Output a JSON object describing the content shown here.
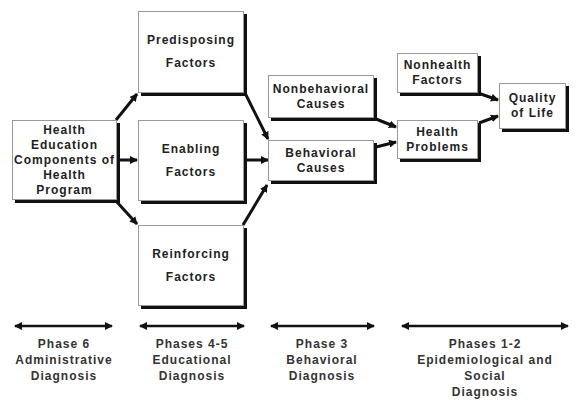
{
  "diagram": {
    "boxes": {
      "health_education": {
        "lines": [
          "Health",
          "Education",
          "Components of",
          "Health Program"
        ]
      },
      "predisposing": {
        "lines": [
          "Predisposing",
          "Factors"
        ]
      },
      "enabling": {
        "lines": [
          "Enabling",
          "Factors"
        ]
      },
      "reinforcing": {
        "lines": [
          "Reinforcing",
          "Factors"
        ]
      },
      "nonbehavioral": {
        "lines": [
          "Nonbehavioral",
          "Causes"
        ]
      },
      "behavioral": {
        "lines": [
          "Behavioral",
          "Causes"
        ]
      },
      "nonhealth": {
        "lines": [
          "Nonhealth",
          "Factors"
        ]
      },
      "health_problems": {
        "lines": [
          "Health",
          "Problems"
        ]
      },
      "quality_of_life": {
        "lines": [
          "Quality",
          "of Life"
        ]
      }
    },
    "edges": [
      {
        "from": "health_education",
        "to": "predisposing"
      },
      {
        "from": "health_education",
        "to": "enabling"
      },
      {
        "from": "health_education",
        "to": "reinforcing"
      },
      {
        "from": "predisposing",
        "to": "behavioral"
      },
      {
        "from": "enabling",
        "to": "behavioral"
      },
      {
        "from": "reinforcing",
        "to": "behavioral"
      },
      {
        "from": "nonbehavioral",
        "to": "health_problems"
      },
      {
        "from": "behavioral",
        "to": "health_problems"
      },
      {
        "from": "nonhealth",
        "to": "quality_of_life"
      },
      {
        "from": "health_problems",
        "to": "quality_of_life"
      }
    ],
    "phases": [
      {
        "lines": [
          "Phase 6",
          "Administrative",
          "Diagnosis"
        ]
      },
      {
        "lines": [
          "Phases 4-5",
          "Educational",
          "Diagnosis"
        ]
      },
      {
        "lines": [
          "Phase 3",
          "Behavioral",
          "Diagnosis"
        ]
      },
      {
        "lines": [
          "Phases 1-2",
          "Epidemiological and Social",
          "Diagnosis"
        ]
      }
    ]
  }
}
